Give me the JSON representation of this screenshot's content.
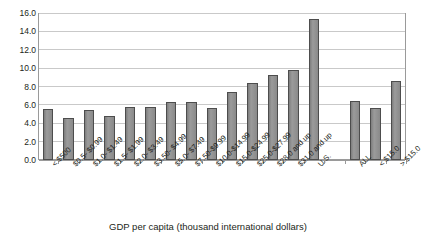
{
  "chart_data": {
    "type": "bar",
    "title": "",
    "xlabel": "GDP per capita (thousand international dollars)",
    "ylabel": "",
    "ylim": [
      0.0,
      16.0
    ],
    "ytick_step": 2.0,
    "grid": true,
    "legend": "none",
    "orientation": "vertical",
    "bar_color": "#8d8d8d",
    "bar_border_color": "#4d4d4d",
    "gridline_color": "#c9c9c9",
    "axis_color": "#9a9a9a",
    "text_color": "#231f20",
    "ytick_labels": [
      "0.0",
      "2.0",
      "4.0",
      "6.0",
      "8.0",
      "10.0",
      "12.0",
      "14.0",
      "16.0"
    ],
    "ytick_values": [
      0.0,
      2.0,
      4.0,
      6.0,
      8.0,
      10.0,
      12.0,
      14.0,
      16.0
    ],
    "categories": [
      "< $500",
      "$0.5- $0.99",
      "$1.0- $1.49",
      "$1.5- $1.99",
      "$2.0- $3.49",
      "$3.50- $4.99",
      "$5.0- $7.49",
      "$7.50-$9.99",
      "$10.0-$14.99",
      "$15.0-$24.99",
      "$25.0-$27.99",
      "$28.0 and up",
      "$31.0 and up",
      "U.S.",
      "",
      "ALL",
      "< $15.0",
      "> $15.0"
    ],
    "values": [
      5.6,
      4.6,
      5.4,
      4.8,
      5.8,
      5.8,
      6.3,
      6.3,
      5.7,
      7.4,
      8.4,
      9.3,
      9.8,
      15.3,
      null,
      6.4,
      5.7,
      8.6
    ]
  }
}
